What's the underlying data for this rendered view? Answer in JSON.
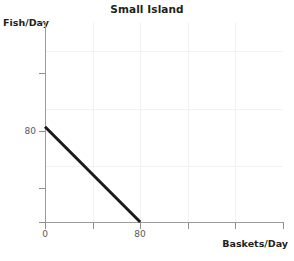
{
  "chart_data": {
    "type": "line",
    "title": "Small Island",
    "xlabel": "Baskets/Day",
    "ylabel": "Fish/Day",
    "series": [
      {
        "name": "production-possibilities-frontier",
        "x": [
          0,
          80
        ],
        "y": [
          80,
          0
        ],
        "color": "#1a1a1a",
        "width": 3
      }
    ],
    "xlim": [
      0,
      200
    ],
    "ylim": [
      0,
      168
    ],
    "xticks": [
      0,
      40,
      80,
      120,
      160,
      200
    ],
    "yticks": [
      0,
      40,
      80,
      120,
      168
    ],
    "xtick_labels": [
      "0",
      "",
      "80",
      "",
      "",
      ""
    ],
    "ytick_labels": [
      "",
      "",
      "80",
      "",
      ""
    ],
    "grid": true,
    "grid_color": "#f2f2f2",
    "axis_color": "#9a9a9a",
    "legend": null
  },
  "axis_ticks": {
    "y": [
      {
        "label": "",
        "top": 22
      },
      {
        "label": "",
        "top": 73
      },
      {
        "label": "80",
        "top": 131
      },
      {
        "label": "",
        "top": 188
      },
      {
        "label": "",
        "top": 222
      }
    ],
    "x": [
      {
        "label": "0",
        "left": 45
      },
      {
        "label": "",
        "left": 93
      },
      {
        "label": "80",
        "left": 140
      },
      {
        "label": "",
        "left": 188
      },
      {
        "label": "",
        "left": 235
      },
      {
        "label": "",
        "left": 283
      }
    ]
  },
  "gridlines": {
    "vertical_left": [
      93,
      140,
      188,
      235
    ],
    "horizontal_top": [
      51,
      109,
      166
    ]
  }
}
